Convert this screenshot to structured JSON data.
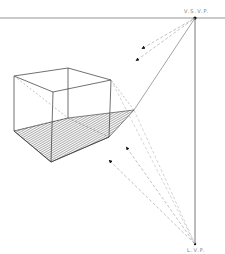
{
  "diagram": {
    "labels": {
      "top_vanishing_point": "V.S.V.P.",
      "bottom_vanishing_point": "L.V.P."
    },
    "colors": {
      "line": "#333333",
      "dashed": "#888888",
      "background": "#ffffff"
    }
  }
}
